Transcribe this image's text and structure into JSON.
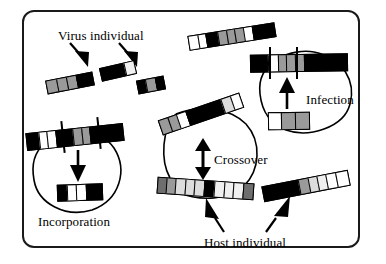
{
  "figure": {
    "type": "diagram",
    "border_color": "#1a1a1a",
    "background": "#ffffff"
  },
  "labels": {
    "virus_individual": "Virus individual",
    "incorporation": "Incorporation",
    "crossover": "Crossover",
    "infection": "Infection",
    "host_individual": "Host individual"
  },
  "palette": {
    "black": "#000000",
    "white": "#ffffff",
    "light1": "#f0f0f0",
    "light2": "#dcdcdc",
    "gray": "#9a9a9a",
    "dark_gray": "#6e6e6e"
  },
  "elements": {
    "virus_fragment_left": {
      "name": "virus-fragment-left",
      "cells": [
        "gray",
        "gray",
        "gray",
        "black"
      ]
    },
    "virus_fragment_middle": {
      "name": "virus-fragment-middle",
      "cells": [
        "black",
        "black",
        "light1"
      ]
    },
    "virus_fragment_right": {
      "name": "virus-fragment-right",
      "cells": [
        "black",
        "gray",
        "black"
      ]
    },
    "host_bar_top": {
      "name": "host-bar-top",
      "cells": [
        "white",
        "white",
        "black",
        "gray",
        "gray",
        "gray",
        "white",
        "black",
        "black"
      ]
    },
    "host_bar_bottom_right": {
      "name": "host-bar-bottom-right",
      "cells": [
        "black",
        "black",
        "black",
        "gray",
        "light2",
        "light1",
        "white",
        "white"
      ]
    },
    "incorporation_bar": {
      "name": "incorporation-host-bar",
      "cells": [
        "black",
        "white",
        "white",
        "black",
        "black",
        "gray",
        "gray",
        "black",
        "black"
      ]
    },
    "incorporation_fragment": {
      "name": "incorporation-virus-fragment",
      "cells": [
        "black",
        "white",
        "white",
        "black"
      ]
    },
    "infection_bar": {
      "name": "infection-host-bar",
      "cells": [
        "black",
        "black",
        "white",
        "gray",
        "gray",
        "gray",
        "black",
        "black",
        "black"
      ]
    },
    "infection_fragment": {
      "name": "infection-virus-fragment",
      "cells": [
        "white",
        "gray",
        "gray"
      ]
    },
    "crossover_bar_top": {
      "name": "crossover-bar-top",
      "cells": [
        "gray",
        "gray",
        "white",
        "black",
        "black",
        "black",
        "light2",
        "white"
      ]
    },
    "crossover_bar_bottom": {
      "name": "crossover-bar-bottom",
      "cells": [
        "dark_gray",
        "gray",
        "light2",
        "light2",
        "light2",
        "black",
        "light1",
        "light1",
        "light1",
        "dark_gray"
      ]
    }
  },
  "annotations": {
    "virus_arrows": 2,
    "host_arrows": 2,
    "incorporation_arrow": "down",
    "infection_arrow": "up",
    "crossover_arrow": "double-vertical"
  }
}
